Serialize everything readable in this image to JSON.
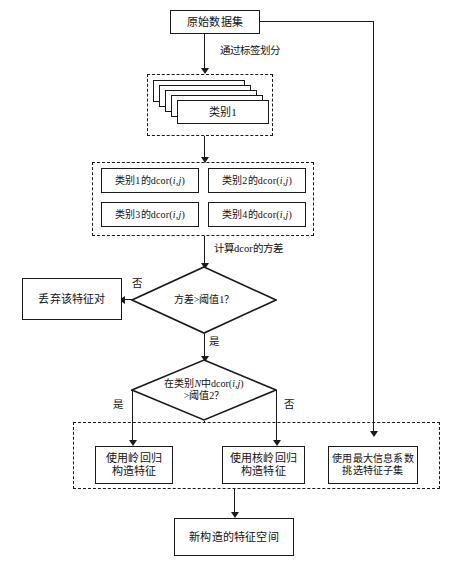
{
  "diagram": {
    "language": "zh-CN",
    "background_color": "#ffffff",
    "line_color": "#1a1a1a",
    "nodes": {
      "raw_dataset": "原始数据集",
      "category_stack_front": "类别1",
      "dcor_cat1": "类别1的dcor(i,j)",
      "dcor_cat2": "类别2的dcor(i,j)",
      "dcor_cat3": "类别3的dcor(i,j)",
      "dcor_cat4": "类别4的dcor(i,j)",
      "discard_feature_pair": "丢弃该特征对",
      "decision_variance_line1": "方差>阈值1？",
      "decision_dcor_line1": "在类别N中dcor(i,j)",
      "decision_dcor_line2": ">阈值2？",
      "ridge_regression_line1": "使用岭回归",
      "ridge_regression_line2": "构造特征",
      "kernel_ridge_line1": "使用核岭回归",
      "kernel_ridge_line2": "构造特征",
      "mic_selection_line1": "使用最大信息系数",
      "mic_selection_line2": "挑选特征子集",
      "new_feature_space": "新构造的特征空间"
    },
    "edge_labels": {
      "split_by_label": "通过标签划分",
      "compute_dcor_variance": "计算dcor的方差",
      "variance_no": "否",
      "variance_yes": "是",
      "dcor_yes": "是",
      "dcor_no": "否"
    },
    "stack_layer_count": 5,
    "groups": {
      "category_group": "类别分组",
      "dcor_group": "dcor计算分组",
      "construction_group": "特征构造分组"
    }
  }
}
